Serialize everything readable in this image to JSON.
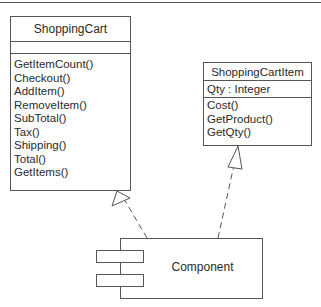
{
  "diagram": {
    "type": "UML component realization diagram",
    "classes": [
      {
        "id": "cart",
        "name": "ShoppingCart",
        "attributes": [],
        "methods": [
          "GetItemCount()",
          "Checkout()",
          "AddItem()",
          "RemoveItem()",
          "SubTotal()",
          "Tax()",
          "Shipping()",
          "Total()",
          "GetItems()"
        ]
      },
      {
        "id": "item",
        "name": "ShoppingCartItem",
        "attributes": [
          "Qty : Integer"
        ],
        "methods": [
          "Cost()",
          "GetProduct()",
          "GetQty()"
        ]
      }
    ],
    "component": {
      "label": "Component"
    },
    "relationships": [
      {
        "from": "Component",
        "to": "ShoppingCart",
        "style": "dashed",
        "arrowhead": "hollow-triangle"
      },
      {
        "from": "Component",
        "to": "ShoppingCartItem",
        "style": "dashed",
        "arrowhead": "hollow-triangle"
      }
    ],
    "colors": {
      "line": "#555555",
      "text": "#2a2a2a",
      "background": "#ffffff"
    }
  }
}
